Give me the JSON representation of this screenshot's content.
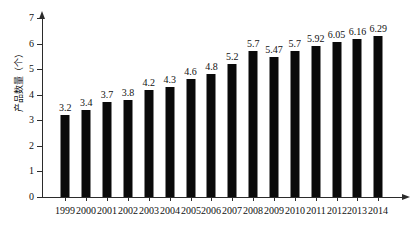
{
  "chart_data": {
    "type": "bar",
    "title": "",
    "subtitle": "",
    "xlabel": "",
    "ylabel": "产品数量（个）",
    "categories": [
      "1999",
      "2000",
      "2001",
      "2002",
      "2003",
      "2004",
      "2005",
      "2006",
      "2007",
      "2008",
      "2009",
      "2010",
      "2011",
      "2012",
      "2013",
      "2014"
    ],
    "values": [
      3.2,
      3.4,
      3.7,
      3.8,
      4.2,
      4.3,
      4.6,
      4.8,
      5.2,
      5.7,
      5.47,
      5.7,
      5.92,
      6.05,
      6.16,
      6.29
    ],
    "value_labels": [
      "3.2",
      "3.4",
      "3.7",
      "3.8",
      "4.2",
      "4.3",
      "4.6",
      "4.8",
      "5.2",
      "5.7",
      "5.47",
      "5.7",
      "5.92",
      "6.05",
      "6.16",
      "6.29"
    ],
    "ylim": [
      0,
      7
    ],
    "xlim_categories": 16,
    "y_ticks": [
      0,
      1,
      2,
      3,
      4,
      5,
      6,
      7
    ],
    "y_tick_labels": [
      "0",
      "1",
      "2",
      "3",
      "4",
      "5",
      "6",
      "7"
    ],
    "grid": false,
    "legend": null,
    "legend_position": "none",
    "series_color": "#0a0a0a",
    "axis_color": "#2b2b2b",
    "background_color": "#ffffff",
    "axis_arrows": true,
    "data_labels_shown": true
  }
}
